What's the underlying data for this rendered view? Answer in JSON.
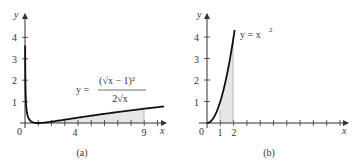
{
  "chart_data": [
    {
      "type": "line",
      "panel_label": "(a)",
      "function_label": "y = (√x − 1)² / (2√x)",
      "equation": {
        "lhs": "y =",
        "numerator": "(√x − 1)²",
        "denominator": "2√x"
      },
      "xlabel": "x",
      "ylabel": "y",
      "x_tick_labels": [
        "0",
        "4",
        "9"
      ],
      "y_tick_labels": [
        "1",
        "2",
        "3",
        "4"
      ],
      "xlim": [
        0,
        10.5
      ],
      "ylim": [
        0,
        4.6
      ],
      "shaded_region": {
        "x_from": 1,
        "x_to": 9,
        "description": "area under curve shaded"
      },
      "x": [
        0.01,
        0.05,
        0.1,
        0.25,
        0.5,
        1,
        2,
        4,
        6,
        9,
        10.5
      ],
      "y": [
        4.05,
        1.8,
        1.08,
        0.5,
        0.06,
        0,
        0.06,
        0.25,
        0.43,
        0.67,
        0.77
      ]
    },
    {
      "type": "line",
      "panel_label": "(b)",
      "function_label": "y = x²",
      "equation": {
        "lhs": "y = x",
        "exp": "2"
      },
      "xlabel": "x",
      "ylabel": "y",
      "x_tick_labels": [
        "0",
        "1",
        "2"
      ],
      "y_tick_labels": [
        "1",
        "2",
        "3",
        "4"
      ],
      "xlim": [
        0,
        10.5
      ],
      "ylim": [
        0,
        4.6
      ],
      "shaded_region": {
        "x_from": 1,
        "x_to": 2,
        "description": "area under curve shaded"
      },
      "x": [
        0,
        0.5,
        1,
        1.5,
        2,
        2.1
      ],
      "y": [
        0,
        0.25,
        1,
        2.25,
        4,
        4.41
      ]
    }
  ]
}
